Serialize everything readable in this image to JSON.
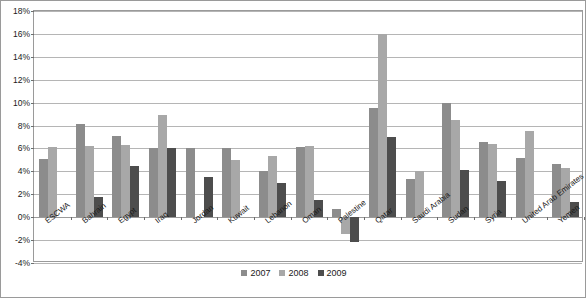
{
  "chart_data": {
    "type": "bar",
    "title": "",
    "subtitle": "",
    "xlabel": "",
    "ylabel": "",
    "ylim": [
      -4,
      18
    ],
    "ytick_step": 2,
    "ytick_labels": [
      "18%",
      "16%",
      "14%",
      "12%",
      "10%",
      "8%",
      "6%",
      "4%",
      "2%",
      "0%",
      "-2%",
      "-4%"
    ],
    "ytick_values": [
      18,
      16,
      14,
      12,
      10,
      8,
      6,
      4,
      2,
      0,
      -2,
      -4
    ],
    "grid": true,
    "legend_position": "bottom",
    "categories": [
      "ESCWA",
      "Bahrain",
      "Egypt",
      "Iraq",
      "Jordan",
      "Kuwait",
      "Lebanon",
      "Oman",
      "Palestine",
      "Qatar",
      "Saudi Arabia",
      "Sudan",
      "Syria",
      "United Arab Emirates",
      "Yemen"
    ],
    "series": [
      {
        "name": "2007",
        "color": "#8c8c8c",
        "values": [
          5.1,
          8.1,
          7.1,
          6.0,
          6.0,
          6.0,
          4.0,
          6.1,
          0.7,
          9.5,
          3.3,
          10.0,
          6.6,
          5.2,
          4.6
        ]
      },
      {
        "name": "2008",
        "color": "#a8a8a8",
        "values": [
          6.1,
          6.2,
          6.3,
          8.9,
          null,
          5.0,
          5.3,
          6.2,
          -1.5,
          16.0,
          4.0,
          8.5,
          6.4,
          7.5,
          4.3
        ]
      },
      {
        "name": "2009",
        "color": "#4d4d4d",
        "values": [
          null,
          1.8,
          4.5,
          6.0,
          3.5,
          null,
          3.0,
          1.5,
          -2.2,
          7.0,
          null,
          4.1,
          3.2,
          null,
          1.3
        ]
      }
    ]
  }
}
